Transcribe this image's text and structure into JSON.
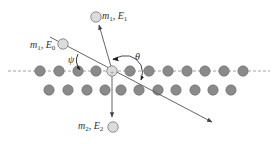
{
  "diagram": {
    "title": "",
    "colors": {
      "lattice_atom": "#8a8a8a",
      "lattice_atom_stroke": "#6a6a6a",
      "projectile_atom": "#dcdcdc",
      "line": "#555555",
      "surface_dash": "#888888"
    },
    "labels": {
      "incident": {
        "m": "m",
        "m_sub": "1",
        "E": "E",
        "E_sub": "0"
      },
      "scattered": {
        "m": "m",
        "m_sub": "1",
        "E": "E",
        "E_sub": "1"
      },
      "recoil": {
        "m": "m",
        "m_sub": "2",
        "E": "E",
        "E_sub": "2"
      },
      "angle_incidence": "ψ",
      "angle_scattering": "θ"
    },
    "lattice": {
      "top_row_y": 71,
      "top_row_x": [
        40,
        59,
        78,
        96,
        130,
        149,
        168,
        187,
        205,
        224,
        243
      ],
      "target_atom": {
        "x": 112,
        "y": 71
      },
      "bottom_row_y": 90,
      "bottom_row_x": [
        49,
        68,
        87,
        105,
        121,
        139,
        158,
        176,
        195,
        213,
        231
      ]
    }
  }
}
